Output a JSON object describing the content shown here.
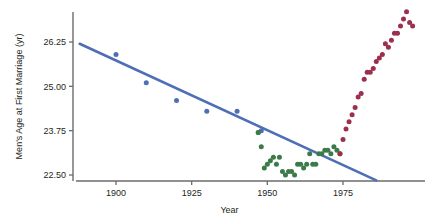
{
  "chart_data": {
    "type": "scatter",
    "title": "",
    "xlabel": "Year",
    "ylabel": "Men's Age at First Marriage (yr)",
    "xlim": [
      1888,
      1998
    ],
    "ylim": [
      22.2,
      27.2
    ],
    "xticks": [
      1900,
      1925,
      1950,
      1975
    ],
    "xtick_labels": [
      "1900",
      "1925",
      "1950",
      "1975"
    ],
    "yticks": [
      22.5,
      23.75,
      25.0,
      26.25
    ],
    "ytick_labels": [
      "22.50",
      "23.75",
      "25.00",
      "26.25"
    ],
    "grid": false,
    "legend": "none",
    "colors": {
      "blue_series": "#4e6fb5",
      "green_series": "#3d7a4a",
      "red_series": "#9c2f4e",
      "trend_line": "#4e6fb5",
      "axis": "#6b6b6b",
      "text": "#231f20"
    },
    "series": [
      {
        "name": "Early period (decennial census)",
        "color": "#4e6fb5",
        "marker": "circle",
        "points": [
          {
            "x": 1900,
            "y": 25.9
          },
          {
            "x": 1910,
            "y": 25.1
          },
          {
            "x": 1920,
            "y": 24.6
          },
          {
            "x": 1930,
            "y": 24.3
          },
          {
            "x": 1940,
            "y": 24.3
          },
          {
            "x": 1947,
            "y": 23.7
          },
          {
            "x": 1948,
            "y": 23.75
          }
        ]
      },
      {
        "name": "Mid century (annual)",
        "color": "#3d7a4a",
        "marker": "circle",
        "points": [
          {
            "x": 1947,
            "y": 23.7
          },
          {
            "x": 1948,
            "y": 23.3
          },
          {
            "x": 1949,
            "y": 22.7
          },
          {
            "x": 1950,
            "y": 22.8
          },
          {
            "x": 1951,
            "y": 22.9
          },
          {
            "x": 1952,
            "y": 23.0
          },
          {
            "x": 1953,
            "y": 22.8
          },
          {
            "x": 1954,
            "y": 23.0
          },
          {
            "x": 1955,
            "y": 22.6
          },
          {
            "x": 1956,
            "y": 22.5
          },
          {
            "x": 1957,
            "y": 22.6
          },
          {
            "x": 1958,
            "y": 22.6
          },
          {
            "x": 1959,
            "y": 22.5
          },
          {
            "x": 1960,
            "y": 22.8
          },
          {
            "x": 1961,
            "y": 22.8
          },
          {
            "x": 1962,
            "y": 22.7
          },
          {
            "x": 1963,
            "y": 22.8
          },
          {
            "x": 1964,
            "y": 23.1
          },
          {
            "x": 1965,
            "y": 22.8
          },
          {
            "x": 1966,
            "y": 22.8
          },
          {
            "x": 1967,
            "y": 23.1
          },
          {
            "x": 1968,
            "y": 23.1
          },
          {
            "x": 1969,
            "y": 23.2
          },
          {
            "x": 1970,
            "y": 23.2
          },
          {
            "x": 1971,
            "y": 23.1
          },
          {
            "x": 1972,
            "y": 23.3
          },
          {
            "x": 1973,
            "y": 23.2
          },
          {
            "x": 1974,
            "y": 23.1
          }
        ]
      },
      {
        "name": "Recent period (rising)",
        "color": "#9c2f4e",
        "marker": "circle",
        "points": [
          {
            "x": 1974,
            "y": 23.1
          },
          {
            "x": 1975,
            "y": 23.5
          },
          {
            "x": 1976,
            "y": 23.8
          },
          {
            "x": 1977,
            "y": 24.0
          },
          {
            "x": 1978,
            "y": 24.2
          },
          {
            "x": 1979,
            "y": 24.4
          },
          {
            "x": 1980,
            "y": 24.7
          },
          {
            "x": 1981,
            "y": 24.8
          },
          {
            "x": 1982,
            "y": 25.2
          },
          {
            "x": 1983,
            "y": 25.4
          },
          {
            "x": 1984,
            "y": 25.4
          },
          {
            "x": 1985,
            "y": 25.5
          },
          {
            "x": 1986,
            "y": 25.7
          },
          {
            "x": 1987,
            "y": 25.8
          },
          {
            "x": 1988,
            "y": 25.9
          },
          {
            "x": 1989,
            "y": 26.2
          },
          {
            "x": 1990,
            "y": 26.1
          },
          {
            "x": 1991,
            "y": 26.3
          },
          {
            "x": 1992,
            "y": 26.5
          },
          {
            "x": 1993,
            "y": 26.5
          },
          {
            "x": 1994,
            "y": 26.7
          },
          {
            "x": 1995,
            "y": 26.9
          },
          {
            "x": 1996,
            "y": 27.1
          },
          {
            "x": 1997,
            "y": 26.8
          },
          {
            "x": 1998,
            "y": 26.7
          }
        ]
      }
    ],
    "trend_line": {
      "name": "Linear fit",
      "color": "#4e6fb5",
      "x0": 1888,
      "y0": 26.2,
      "x1": 1986,
      "y1": 22.35
    }
  }
}
